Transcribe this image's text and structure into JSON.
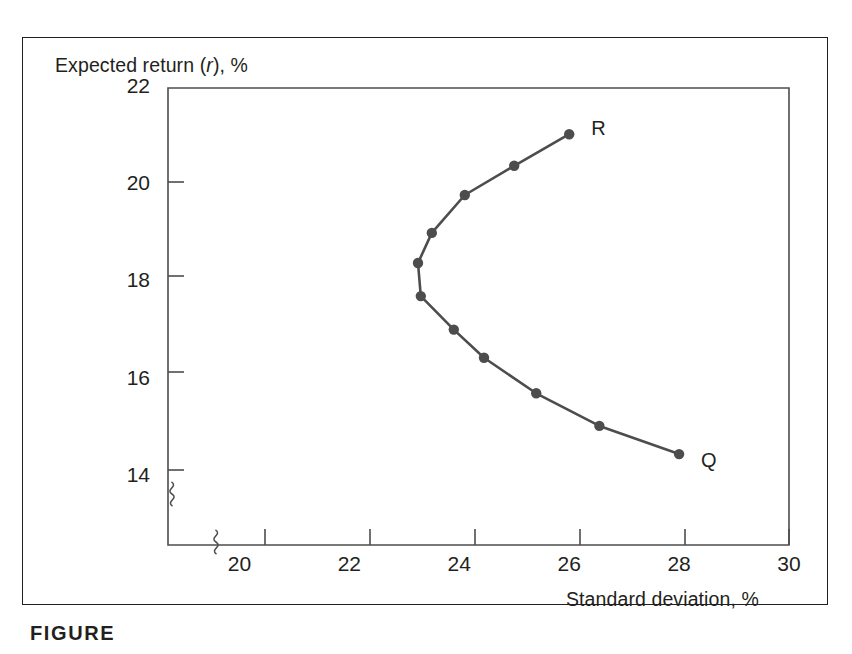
{
  "figure": {
    "caption": "FIGURE"
  },
  "chart_data": {
    "type": "line",
    "title": "",
    "xlabel": "Standard deviation, %",
    "ylabel_plain": "Expected return (r), %",
    "ylabel_prefix": "Expected return (",
    "ylabel_italic": "r",
    "ylabel_suffix": "), %",
    "xlim": [
      18.7,
      30
    ],
    "ylim": [
      12.6,
      22
    ],
    "x_ticks": [
      20,
      22,
      24,
      26,
      28,
      30
    ],
    "y_ticks": [
      14,
      16,
      18,
      20,
      22
    ],
    "x_tick_labels": [
      "20",
      "22",
      "24",
      "26",
      "28",
      "30"
    ],
    "y_tick_labels": [
      "14",
      "16",
      "18",
      "20",
      "22"
    ],
    "grid": false,
    "legend": "none",
    "axis_break_x": true,
    "axis_break_y": true,
    "series": [
      {
        "name": "efficient frontier",
        "marker": "circle",
        "color": "#4d4d4d",
        "x": [
          28.0,
          26.55,
          25.4,
          24.45,
          23.9,
          23.3,
          23.25,
          23.5,
          24.1,
          25.0,
          26.0
        ],
        "y": [
          14.47,
          15.05,
          15.72,
          16.45,
          17.03,
          17.72,
          18.4,
          19.02,
          19.8,
          20.4,
          21.05
        ]
      }
    ],
    "annotations": [
      {
        "label": "Q",
        "x": 28.0,
        "y": 14.47,
        "dx": 22,
        "dy": 8
      },
      {
        "label": "R",
        "x": 26.0,
        "y": 21.05,
        "dx": 22,
        "dy": -4
      }
    ]
  }
}
